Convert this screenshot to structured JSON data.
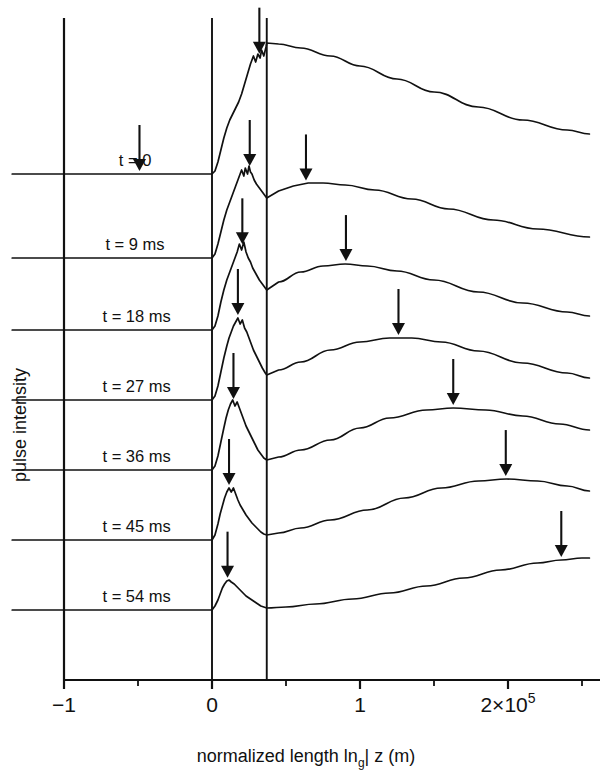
{
  "figure": {
    "background": "#ffffff",
    "ink": "#111111",
    "ylabel": "pulse intensity",
    "xlabel_pre": "normalized length ln",
    "xlabel_sub": "g",
    "xlabel_post": "| z (m)"
  },
  "chart_data": {
    "type": "line",
    "title": "",
    "xlabel": "normalized length ln_g| z (m)",
    "ylabel": "pulse intensity",
    "xlim": [
      -1.35,
      2.55
    ],
    "xticks": [
      -1,
      0,
      1,
      2
    ],
    "xticklabels": [
      "−1",
      "0",
      "1",
      "2×10⁵"
    ],
    "xminorticks": [
      -0.5,
      0.5,
      1.5,
      2.5
    ],
    "x_exponent_note": "2×10^5",
    "yticks": [],
    "grid": false,
    "legend": "none",
    "vertical_marker_lines": [
      0.0,
      0.37
    ],
    "stacked_offset_traces": true,
    "annotation_marker": "down-arrow",
    "series": [
      {
        "name": "t = 0",
        "label": "t = 0",
        "label_x": -0.63,
        "baseline_y_px": 174,
        "arrows_x": [
          -0.49,
          0.32
        ],
        "x": [
          -1.35,
          -0.1,
          0.0,
          0.02,
          0.04,
          0.06,
          0.08,
          0.1,
          0.12,
          0.14,
          0.16,
          0.18,
          0.2,
          0.22,
          0.24,
          0.26,
          0.28,
          0.295,
          0.31,
          0.325,
          0.335,
          0.35,
          0.365,
          0.37,
          0.45,
          0.6,
          0.8,
          1.0,
          1.25,
          1.5,
          1.8,
          2.1,
          2.4,
          2.55
        ],
        "y": [
          0,
          0,
          0,
          3,
          12,
          24,
          36,
          46,
          54,
          60,
          66,
          72,
          80,
          90,
          100,
          110,
          118,
          112,
          120,
          116,
          124,
          118,
          127,
          131,
          130,
          126,
          118,
          108,
          95,
          82,
          67,
          54,
          44,
          40
        ]
      },
      {
        "name": "t = 9 ms",
        "label": "t = 9 ms",
        "label_x": -0.72,
        "baseline_y_px": 258,
        "arrows_x": [
          0.255,
          0.635
        ],
        "x": [
          -1.35,
          -0.1,
          0.0,
          0.02,
          0.04,
          0.06,
          0.08,
          0.1,
          0.12,
          0.14,
          0.16,
          0.18,
          0.2,
          0.215,
          0.225,
          0.24,
          0.25,
          0.26,
          0.27,
          0.285,
          0.3,
          0.32,
          0.34,
          0.36,
          0.37,
          0.45,
          0.55,
          0.65,
          0.75,
          0.9,
          1.1,
          1.35,
          1.6,
          1.9,
          2.2,
          2.55
        ],
        "y": [
          0,
          0,
          0,
          4,
          14,
          26,
          38,
          48,
          56,
          64,
          72,
          80,
          88,
          82,
          90,
          84,
          92,
          86,
          84,
          78,
          74,
          70,
          66,
          62,
          60,
          67,
          72,
          75,
          75,
          73,
          68,
          59,
          49,
          38,
          29,
          21
        ]
      },
      {
        "name": "t = 18 ms",
        "label": "t = 18 ms",
        "label_x": -0.74,
        "baseline_y_px": 330,
        "arrows_x": [
          0.205,
          0.905
        ],
        "x": [
          -1.35,
          -0.1,
          0.0,
          0.02,
          0.04,
          0.06,
          0.08,
          0.1,
          0.12,
          0.14,
          0.155,
          0.17,
          0.185,
          0.2,
          0.215,
          0.23,
          0.245,
          0.26,
          0.275,
          0.29,
          0.305,
          0.32,
          0.34,
          0.36,
          0.37,
          0.45,
          0.6,
          0.75,
          0.9,
          1.05,
          1.25,
          1.5,
          1.8,
          2.1,
          2.4,
          2.55
        ],
        "y": [
          0,
          0,
          0,
          4,
          14,
          28,
          40,
          50,
          58,
          66,
          72,
          78,
          86,
          80,
          88,
          78,
          72,
          68,
          62,
          58,
          54,
          50,
          46,
          42,
          40,
          48,
          58,
          64,
          66,
          64,
          59,
          50,
          38,
          27,
          18,
          14
        ]
      },
      {
        "name": "t = 27 ms",
        "label": "t = 27 ms",
        "label_x": -0.74,
        "baseline_y_px": 400,
        "arrows_x": [
          0.175,
          1.26
        ],
        "x": [
          -1.35,
          -0.1,
          0.0,
          0.02,
          0.04,
          0.06,
          0.08,
          0.1,
          0.115,
          0.13,
          0.145,
          0.16,
          0.175,
          0.19,
          0.205,
          0.22,
          0.235,
          0.25,
          0.265,
          0.28,
          0.3,
          0.32,
          0.34,
          0.36,
          0.37,
          0.45,
          0.6,
          0.8,
          1.0,
          1.2,
          1.35,
          1.55,
          1.8,
          2.1,
          2.4,
          2.55
        ],
        "y": [
          0,
          0,
          0,
          4,
          14,
          28,
          42,
          54,
          62,
          68,
          74,
          78,
          82,
          76,
          80,
          72,
          68,
          62,
          56,
          50,
          44,
          38,
          32,
          27,
          25,
          30,
          38,
          50,
          58,
          62,
          62,
          58,
          49,
          37,
          27,
          22
        ]
      },
      {
        "name": "t = 36 ms",
        "label": "t = 36 ms",
        "label_x": -0.74,
        "baseline_y_px": 470,
        "arrows_x": [
          0.145,
          1.63
        ],
        "x": [
          -1.35,
          -0.1,
          0.0,
          0.02,
          0.04,
          0.06,
          0.08,
          0.095,
          0.11,
          0.125,
          0.14,
          0.155,
          0.17,
          0.185,
          0.2,
          0.215,
          0.23,
          0.25,
          0.27,
          0.29,
          0.31,
          0.33,
          0.35,
          0.37,
          0.45,
          0.6,
          0.8,
          1.0,
          1.2,
          1.45,
          1.63,
          1.85,
          2.1,
          2.35,
          2.55
        ],
        "y": [
          0,
          0,
          0,
          4,
          14,
          28,
          42,
          52,
          60,
          66,
          70,
          64,
          68,
          62,
          56,
          50,
          44,
          38,
          32,
          26,
          20,
          16,
          12,
          10,
          13,
          20,
          30,
          42,
          52,
          60,
          62,
          60,
          54,
          46,
          40
        ]
      },
      {
        "name": "t = 45 ms",
        "label": "t = 45 ms",
        "label_x": -0.74,
        "baseline_y_px": 540,
        "arrows_x": [
          0.115,
          1.985
        ],
        "x": [
          -1.35,
          -0.1,
          0.0,
          0.02,
          0.04,
          0.055,
          0.07,
          0.085,
          0.1,
          0.115,
          0.13,
          0.145,
          0.16,
          0.175,
          0.19,
          0.21,
          0.23,
          0.25,
          0.27,
          0.29,
          0.31,
          0.33,
          0.35,
          0.37,
          0.45,
          0.6,
          0.8,
          1.05,
          1.3,
          1.55,
          1.8,
          1.99,
          2.2,
          2.4,
          2.55
        ],
        "y": [
          0,
          0,
          0,
          5,
          16,
          26,
          34,
          42,
          48,
          52,
          48,
          52,
          46,
          40,
          35,
          30,
          25,
          21,
          17,
          14,
          11,
          8,
          6,
          5,
          7,
          12,
          20,
          30,
          42,
          52,
          59,
          61,
          59,
          54,
          49
        ]
      },
      {
        "name": "t = 54 ms",
        "label": "t = 54 ms",
        "label_x": -0.74,
        "baseline_y_px": 610,
        "arrows_x": [
          0.105,
          2.36
        ],
        "x": [
          -1.35,
          -0.1,
          0.0,
          0.02,
          0.04,
          0.055,
          0.07,
          0.085,
          0.1,
          0.115,
          0.13,
          0.15,
          0.17,
          0.19,
          0.21,
          0.23,
          0.25,
          0.27,
          0.29,
          0.31,
          0.33,
          0.35,
          0.37,
          0.5,
          0.7,
          0.95,
          1.2,
          1.45,
          1.7,
          1.95,
          2.2,
          2.36,
          2.5,
          2.55
        ],
        "y": [
          0,
          0,
          0,
          4,
          10,
          16,
          22,
          26,
          29,
          30,
          28,
          26,
          23,
          20,
          17,
          14,
          12,
          10,
          8,
          6,
          4,
          3,
          2,
          3,
          6,
          11,
          17,
          24,
          32,
          40,
          47,
          50,
          52,
          52
        ]
      }
    ]
  }
}
